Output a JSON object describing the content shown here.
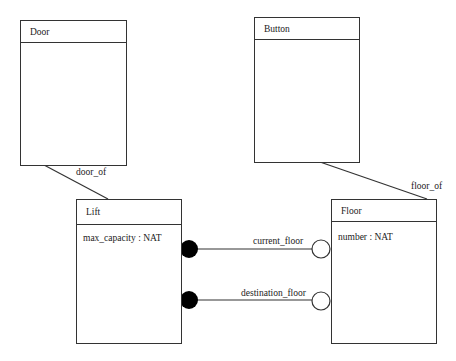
{
  "diagram": {
    "classes": {
      "door": {
        "name": "Door",
        "attributes": []
      },
      "button": {
        "name": "Button",
        "attributes": []
      },
      "lift": {
        "name": "Lift",
        "attributes": [
          "max_capacity : NAT"
        ]
      },
      "floor": {
        "name": "Floor",
        "attributes": [
          "number : NAT"
        ]
      }
    },
    "relations": {
      "door_of": {
        "label": "door_of",
        "from": "Door",
        "to": "Lift"
      },
      "floor_of": {
        "label": "floor_of",
        "from": "Button",
        "to": "Floor"
      },
      "current_floor": {
        "label": "current_floor",
        "from": "Lift",
        "to": "Floor",
        "from_end": "filled-circle",
        "to_end": "open-circle"
      },
      "destination_floor": {
        "label": "destination_floor",
        "from": "Lift",
        "to": "Floor",
        "from_end": "filled-circle",
        "to_end": "open-circle"
      }
    },
    "colors": {
      "line": "#333333",
      "background": "#ffffff",
      "filled_end": "#000000"
    }
  }
}
